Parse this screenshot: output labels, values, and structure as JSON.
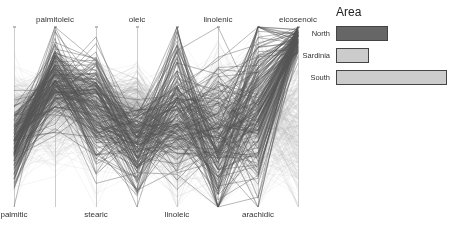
{
  "chart_data": {
    "type": "parallel_coordinates",
    "title": "",
    "axes": [
      {
        "name": "palmitic",
        "label_pos": "bottom",
        "x": 14
      },
      {
        "name": "palmitoleic",
        "label_pos": "top",
        "x": 55
      },
      {
        "name": "stearic",
        "label_pos": "bottom",
        "x": 96
      },
      {
        "name": "oleic",
        "label_pos": "top",
        "x": 137
      },
      {
        "name": "linoleic",
        "label_pos": "bottom",
        "x": 177
      },
      {
        "name": "linolenic",
        "label_pos": "top",
        "x": 218
      },
      {
        "name": "arachidic",
        "label_pos": "bottom",
        "x": 258
      },
      {
        "name": "eicosenoic",
        "label_pos": "top",
        "x": 298
      }
    ],
    "axis_range_normalized": [
      0,
      1
    ],
    "series": [
      {
        "name": "North",
        "color": "#555555",
        "opacity": 0.7,
        "count": 151,
        "profile_center": [
          0.35,
          0.72,
          0.55,
          0.35,
          0.55,
          0.35,
          0.55,
          0.95
        ],
        "profile_spread": [
          0.12,
          0.12,
          0.15,
          0.12,
          0.2,
          0.25,
          0.25,
          0.05
        ]
      },
      {
        "name": "Sardinia",
        "color": "#999999",
        "opacity": 0.35,
        "count": 98,
        "profile_center": [
          0.45,
          0.65,
          0.6,
          0.55,
          0.4,
          0.45,
          0.5,
          0.92
        ],
        "profile_spread": [
          0.08,
          0.08,
          0.1,
          0.08,
          0.1,
          0.12,
          0.12,
          0.04
        ]
      },
      {
        "name": "South",
        "color": "#bbbbbb",
        "opacity": 0.25,
        "count": 323,
        "profile_center": [
          0.45,
          0.55,
          0.5,
          0.45,
          0.4,
          0.45,
          0.5,
          0.45
        ],
        "profile_spread": [
          0.15,
          0.15,
          0.15,
          0.15,
          0.18,
          0.2,
          0.2,
          0.2
        ]
      }
    ],
    "legend_position": "right",
    "grid": false
  },
  "legend": {
    "title": "Area",
    "items": [
      {
        "label": "North",
        "count": 151,
        "fill": "#666666"
      },
      {
        "label": "Sardinia",
        "count": 98,
        "fill": "#cccccc"
      },
      {
        "label": "South",
        "count": 323,
        "fill": "#cccccc"
      }
    ]
  }
}
